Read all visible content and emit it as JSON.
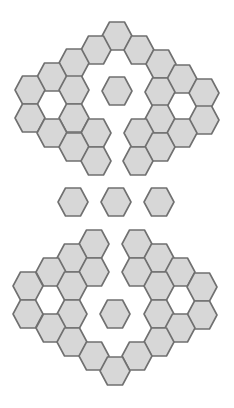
{
  "diagram": {
    "title": "",
    "style": {
      "background": "#ffffff",
      "hex_fill": "#d7d7d7",
      "hex_stroke": "#707070",
      "stroke_width": 1.6,
      "hex_rx": 15,
      "hex_ry": 14,
      "orientation": "flat-top"
    },
    "groups": [
      {
        "name": "top-cluster",
        "tiles": [
          [
            117,
            36
          ],
          [
            96,
            50
          ],
          [
            139,
            50
          ],
          [
            74,
            63
          ],
          [
            161,
            64
          ],
          [
            52,
            77
          ],
          [
            182,
            79
          ],
          [
            30,
            90
          ],
          [
            74,
            90
          ],
          [
            117,
            91
          ],
          [
            160,
            92
          ],
          [
            204,
            93
          ],
          [
            30,
            118
          ],
          [
            74,
            118
          ],
          [
            160,
            119
          ],
          [
            204,
            120
          ],
          [
            52,
            133
          ],
          [
            96,
            133
          ],
          [
            139,
            133
          ],
          [
            182,
            133
          ],
          [
            74,
            147
          ],
          [
            160,
            147
          ],
          [
            96,
            161
          ],
          [
            138,
            161
          ]
        ]
      },
      {
        "name": "middle-row",
        "tiles": [
          [
            73,
            202
          ],
          [
            116,
            202
          ],
          [
            159,
            202
          ]
        ]
      },
      {
        "name": "bottom-cluster",
        "tiles": [
          [
            94,
            244
          ],
          [
            137,
            244
          ],
          [
            72,
            258
          ],
          [
            159,
            258
          ],
          [
            51,
            272
          ],
          [
            94,
            272
          ],
          [
            137,
            272
          ],
          [
            180,
            272
          ],
          [
            28,
            286
          ],
          [
            72,
            286
          ],
          [
            159,
            286
          ],
          [
            202,
            287
          ],
          [
            28,
            314
          ],
          [
            72,
            314
          ],
          [
            115,
            314
          ],
          [
            159,
            314
          ],
          [
            202,
            315
          ],
          [
            51,
            328
          ],
          [
            180,
            328
          ],
          [
            72,
            342
          ],
          [
            159,
            342
          ],
          [
            94,
            356
          ],
          [
            137,
            356
          ],
          [
            115,
            371
          ]
        ]
      }
    ]
  }
}
